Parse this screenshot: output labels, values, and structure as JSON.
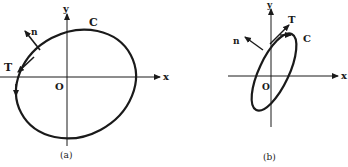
{
  "figure": {
    "panel_a": {
      "caption": "(a)",
      "x_label": "x",
      "y_label": "y",
      "origin_label": "O",
      "curve_label": "C",
      "tangent_label": "T",
      "normal_label": "n"
    },
    "panel_b": {
      "caption": "(b)",
      "x_label": "x",
      "y_label": "y",
      "origin_label": "O",
      "curve_label": "C",
      "tangent_label": "T",
      "normal_label": "n"
    },
    "colors": {
      "ink": "#1a1a1a",
      "background": "#ffffff"
    }
  }
}
